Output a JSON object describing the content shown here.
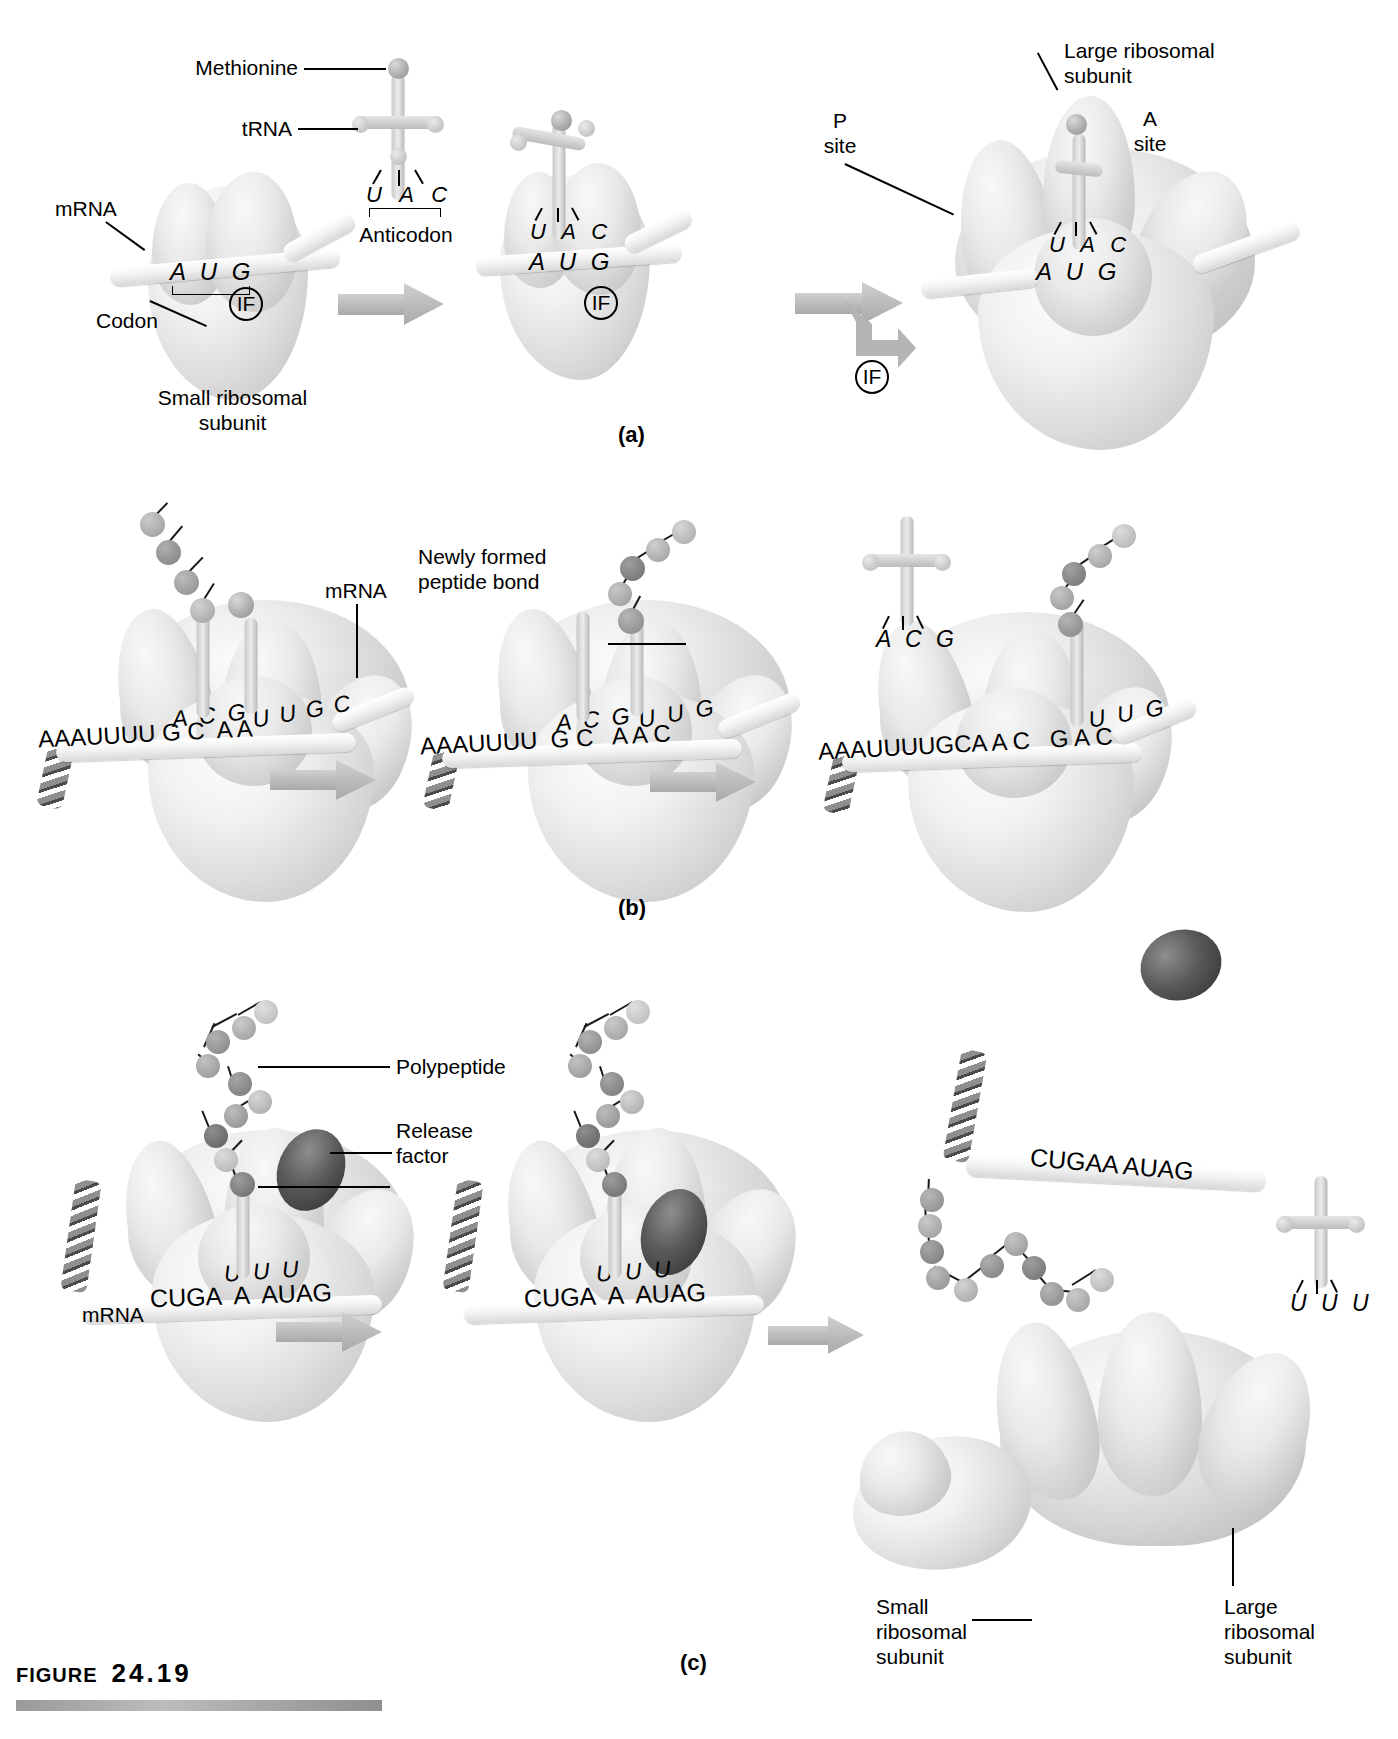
{
  "figure": {
    "label_word": "Figure",
    "number": "24.19"
  },
  "panels": [
    {
      "id": "a",
      "letter": "(a)"
    },
    {
      "id": "b",
      "letter": "(b)"
    },
    {
      "id": "c",
      "letter": "(c)"
    }
  ],
  "panel_a": {
    "labels": {
      "methionine": "Methionine",
      "trna": "tRNA",
      "anticodon": "Anticodon",
      "mrna": "mRNA",
      "codon": "Codon",
      "small_subunit": "Small ribosomal\nsubunit",
      "large_subunit": "Large ribosomal\nsubunit",
      "p_site": "P\nsite",
      "a_site": "A\nsite",
      "initiation_factor": "IF"
    },
    "sequences": {
      "step1_codon": "A U G",
      "step1_anticodon": "U A C",
      "step2_codon": "A U G",
      "step2_anticodon": "U A C",
      "step3_codon": "A U G",
      "step3_anticodon": "U A C"
    }
  },
  "panel_b": {
    "labels": {
      "mrna": "mRNA",
      "peptide_bond": "Newly formed\npeptide bond"
    },
    "sequences": {
      "step1_mrna": "AAAUUUU G C  A A",
      "step1_anticodon_p": "A C G",
      "step1_anticodon_a": "U U G C",
      "step2_mrna": "AAAUUUU  G C   A A C",
      "step2_anticodon_p": "A C G",
      "step2_anticodon_a": "U U G",
      "step3_mrna": "AAAUUUUGCA A C   G A C",
      "step3_anticodon": "U U G",
      "step3_free_trna_anticodon": "A C G"
    }
  },
  "panel_c": {
    "labels": {
      "polypeptide": "Polypeptide",
      "release_factor": "Release\nfactor",
      "mrna": "mRNA",
      "small_subunit": "Small\nribosomal\nsubunit",
      "large_subunit": "Large\nribosomal\nsubunit"
    },
    "sequences": {
      "step1_mrna": "CUGA  A  AUAG",
      "step1_anticodon": "U U U",
      "step2_mrna": "CUGA  A  AUAG",
      "step2_anticodon": "U U U",
      "step3_mrna": "CUGAA AUAG",
      "step3_free_trna_anticodon": "U U U"
    }
  },
  "colors": {
    "ink": "#000000",
    "arrow_gray": "#b4b4b4",
    "subunit_gray": "#d8d8d8",
    "release_factor_dark": "#3a3a3a",
    "rule_gray": "#9a9a9a"
  }
}
